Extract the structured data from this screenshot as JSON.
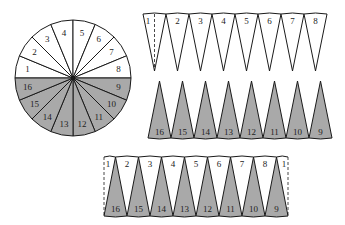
{
  "colors": {
    "background": "#ffffff",
    "stroke": "#1a1a1a",
    "shaded": "#a9a9a9",
    "unshaded": "#ffffff"
  },
  "circle": {
    "cx": 73,
    "cy": 78,
    "r": 58,
    "sector_count": 16,
    "top_labels": [
      "1",
      "2",
      "3",
      "4",
      "5",
      "6",
      "7",
      "8"
    ],
    "bottom_labels": [
      "9",
      "10",
      "11",
      "12",
      "13",
      "14",
      "15",
      "16"
    ],
    "shaded_half": "bottom"
  },
  "top_row": {
    "x": 143,
    "y_top": 14,
    "y_tip": 71,
    "sector_width": 23,
    "labels": [
      "1",
      "2",
      "3",
      "4",
      "5",
      "6",
      "7",
      "8"
    ],
    "dashed_bisector_on": "1",
    "shaded": false
  },
  "middle_row": {
    "x": 148,
    "y_tip": 81,
    "y_base": 138,
    "sector_width": 23,
    "labels": [
      "16",
      "15",
      "14",
      "13",
      "12",
      "11",
      "10",
      "9"
    ],
    "shaded": true
  },
  "bottom_strip": {
    "x": 104,
    "y_top": 157,
    "y_bottom": 216,
    "sector_width": 23,
    "top_labels": [
      "1",
      "2",
      "3",
      "4",
      "5",
      "6",
      "7",
      "8",
      "1"
    ],
    "bottom_labels": [
      "16",
      "15",
      "14",
      "13",
      "12",
      "11",
      "10",
      "9"
    ],
    "dashed_ends": true
  }
}
